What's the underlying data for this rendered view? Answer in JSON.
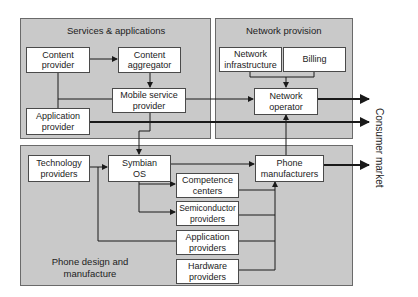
{
  "panels": {
    "services": {
      "title": "Services & applications"
    },
    "network": {
      "title": "Network provision"
    },
    "phone": {
      "title": "Phone design and\nmanufacture"
    }
  },
  "nodes": {
    "content_provider": "Content\nprovider",
    "content_aggregator": "Content\naggregator",
    "mobile_service_provider": "Mobile service\nprovider",
    "application_provider": "Application\nprovider",
    "network_infrastructure": "Network\ninfrastructure",
    "billing": "Billing",
    "network_operator": "Network\noperator",
    "technology_providers": "Technology\nproviders",
    "symbian_os": "Symbian\nOS",
    "competence_centers": "Competence\ncenters",
    "semiconductor_providers": "Semiconductor\nproviders",
    "application_providers": "Application\nproviders",
    "hardware_providers": "Hardware\nproviders",
    "phone_manufacturers": "Phone\nmanufacturers"
  },
  "output_label": "Consumer market",
  "colors": {
    "panel_fill": "#c9c9c9",
    "node_fill": "#ffffff",
    "line": "#1a1a1a"
  }
}
